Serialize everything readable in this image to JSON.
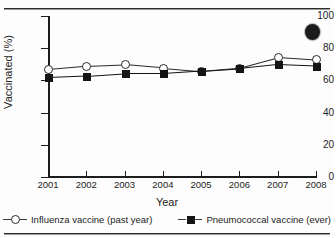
{
  "chart_data": {
    "type": "line",
    "title": "",
    "xlabel": "Year",
    "ylabel": "Vaccinated (%)",
    "categories": [
      "2001",
      "2002",
      "2003",
      "2004",
      "2005",
      "2006",
      "2007",
      "2008"
    ],
    "x": [
      2001,
      2002,
      2003,
      2004,
      2005,
      2006,
      2007,
      2008
    ],
    "xlim": [
      2001,
      2008
    ],
    "ylim": [
      0,
      100
    ],
    "yticks": [
      0,
      20,
      40,
      60,
      80,
      100
    ],
    "ytick_labels": [
      "0",
      "20",
      "40",
      "60",
      "80",
      "100"
    ],
    "grid": false,
    "legend_position": "bottom",
    "series": [
      {
        "name": "Influenza vaccine (past year)",
        "marker": "open-circle",
        "color": "#2a2a2a",
        "values": [
          67,
          69,
          70,
          68,
          66,
          68,
          74.5,
          73
        ]
      },
      {
        "name": "Pneumococcal vaccine (ever)",
        "marker": "filled-square",
        "color": "#141414",
        "values": [
          62,
          63,
          64.5,
          64.5,
          66,
          67.5,
          70,
          69
        ]
      }
    ]
  },
  "artifact": {
    "name": "scan-blob"
  }
}
